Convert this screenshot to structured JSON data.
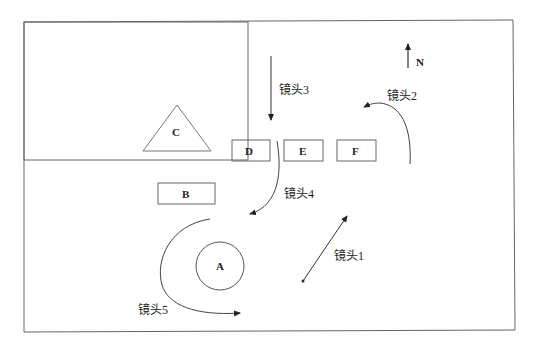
{
  "diagram": {
    "frame": {
      "x": 24,
      "y": 22,
      "w": 224,
      "h": 138
    },
    "compass": {
      "label": "N",
      "direction": "north"
    },
    "objects": [
      {
        "id": "A",
        "shape": "circle",
        "label": "A"
      },
      {
        "id": "B",
        "shape": "rectangle",
        "label": "B"
      },
      {
        "id": "C",
        "shape": "triangle",
        "label": "C"
      },
      {
        "id": "D",
        "shape": "rectangle",
        "label": "D"
      },
      {
        "id": "E",
        "shape": "rectangle",
        "label": "E"
      },
      {
        "id": "F",
        "shape": "rectangle",
        "label": "F"
      }
    ],
    "camera_moves": [
      {
        "id": "shot1",
        "label": "镜头1",
        "path": "straight diagonal toward northeast"
      },
      {
        "id": "shot2",
        "label": "镜头2",
        "path": "curve from south up then turning west"
      },
      {
        "id": "shot3",
        "label": "镜头3",
        "path": "straight downward (north to south)"
      },
      {
        "id": "shot4",
        "label": "镜头4",
        "path": "curve downward then turning southwest"
      },
      {
        "id": "shot5",
        "label": "镜头5",
        "path": "arc around A from north, west, to south-east"
      }
    ],
    "colors": {
      "stroke": "#444444",
      "background": "#ffffff",
      "text": "#222222"
    }
  }
}
